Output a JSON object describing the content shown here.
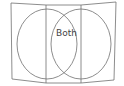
{
  "diagram": {
    "type": "venn",
    "intersection_label": "Both",
    "stroke_color": "#6b6b6b",
    "background": "#ffffff"
  }
}
